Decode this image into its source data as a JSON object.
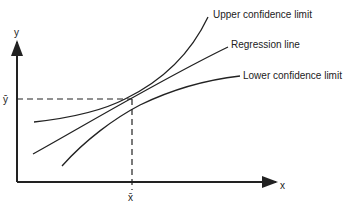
{
  "diagram": {
    "type": "regression confidence limits",
    "axes": {
      "x_label": "x",
      "y_label": "y"
    },
    "means": {
      "x_mean_label": "x̄",
      "y_mean_label": "ȳ"
    },
    "curves": [
      {
        "id": "upper",
        "label": "Upper confidence limit"
      },
      {
        "id": "regression",
        "label": "Regression line"
      },
      {
        "id": "lower",
        "label": "Lower confidence limit"
      }
    ]
  }
}
